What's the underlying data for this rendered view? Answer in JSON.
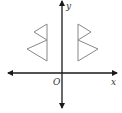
{
  "diagram": {
    "type": "coordinate-plane-reflection",
    "axes": {
      "x_label": "x",
      "y_label": "y",
      "origin_label": "O",
      "color": "#1a1a1a"
    },
    "figures": [
      {
        "name": "left-figure",
        "description": "two stacked triangles opening left, sharing a vertical edge",
        "stroke": "#888888"
      },
      {
        "name": "right-figure",
        "description": "mirror image of left figure across the y-axis",
        "stroke": "#888888"
      }
    ]
  }
}
